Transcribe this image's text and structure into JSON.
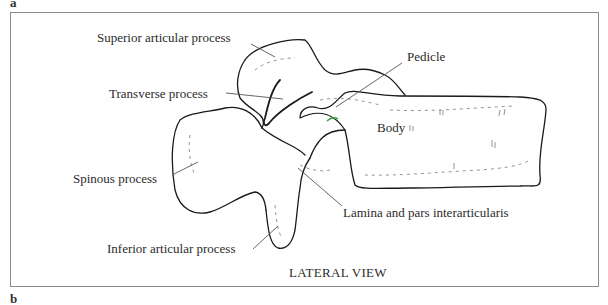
{
  "figure": {
    "panel_top_letter": "a",
    "panel_bottom_letter": "b",
    "view_caption": "LATERAL VIEW",
    "labels": {
      "superior_articular_process": "Superior articular process",
      "transverse_process": "Transverse process",
      "pedicle": "Pedicle",
      "body": "Body",
      "spinous_process": "Spinous process",
      "lamina_pars": "Lamina and pars interarticularis",
      "inferior_articular_process": "Inferior articular process"
    },
    "colors": {
      "outline": "#1a1a1a",
      "leader_line": "#555555",
      "frame": "#8a8a8a",
      "accent_highlight": "#3aa63a"
    }
  }
}
